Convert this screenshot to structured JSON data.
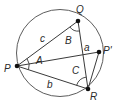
{
  "diagram": {
    "type": "inscribed-triangle-circle",
    "points": {
      "P": "P",
      "Q": "Q",
      "R": "R",
      "Pprime": "P'"
    },
    "sides": {
      "a": "a",
      "b": "b",
      "c": "c"
    },
    "angles": {
      "A": "A",
      "B": "B",
      "C": "C"
    },
    "colors": {
      "stroke": "#3a3a3a",
      "point": "#111111",
      "label": "#2a2a2a"
    }
  }
}
